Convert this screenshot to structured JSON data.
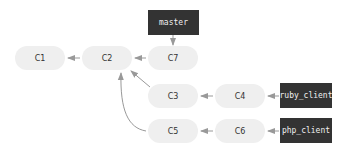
{
  "diagram": {
    "type": "git-branch-graph",
    "commits": [
      {
        "id": "C1",
        "label": "C1"
      },
      {
        "id": "C2",
        "label": "C2"
      },
      {
        "id": "C7",
        "label": "C7"
      },
      {
        "id": "C3",
        "label": "C3"
      },
      {
        "id": "C4",
        "label": "C4"
      },
      {
        "id": "C5",
        "label": "C5"
      },
      {
        "id": "C6",
        "label": "C6"
      }
    ],
    "refs": [
      {
        "id": "master",
        "label": "master",
        "points_to": "C7"
      },
      {
        "id": "ruby_client",
        "label": "ruby_client",
        "points_to": "C4"
      },
      {
        "id": "php_client",
        "label": "php_client",
        "points_to": "C6"
      }
    ],
    "edges": [
      {
        "from": "C2",
        "to": "C1"
      },
      {
        "from": "C7",
        "to": "C2"
      },
      {
        "from": "C3",
        "to": "C2"
      },
      {
        "from": "C5",
        "to": "C2"
      },
      {
        "from": "C4",
        "to": "C3"
      },
      {
        "from": "C6",
        "to": "C5"
      },
      {
        "from": "master",
        "to": "C7"
      },
      {
        "from": "ruby_client",
        "to": "C4"
      },
      {
        "from": "php_client",
        "to": "C6"
      }
    ],
    "colors": {
      "commit_fill": "#efefef",
      "ref_fill": "#333333",
      "ref_text": "#f0f0f0",
      "arrow": "#999999"
    }
  }
}
